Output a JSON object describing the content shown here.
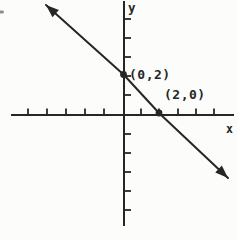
{
  "diagram": {
    "colors": {
      "background": "#fcfcfb",
      "ink": "#262626",
      "stray": "#8f8f8f"
    },
    "x_axis": {
      "label": "x",
      "axis_y": 115,
      "x_start": 11,
      "x_end": 234,
      "label_pos": {
        "x": 226,
        "y": 133
      },
      "label_font_size": 11.5,
      "ticks": [
        28,
        47,
        66,
        85,
        104,
        141,
        159,
        178,
        196,
        214
      ],
      "tick_length": 6.5
    },
    "y_axis": {
      "label": "y",
      "axis_x": 124,
      "y_start": 1,
      "y_end": 226,
      "label_pos": {
        "x": 128,
        "y": 12
      },
      "label_font_size": 12.5,
      "ticks": [
        19,
        38,
        57,
        76,
        95,
        134,
        153,
        172,
        191,
        210
      ],
      "tick_length": 7
    },
    "line": {
      "path": [
        [
          46,
          5
        ],
        [
          123.5,
          74.5
        ],
        [
          159,
          113
        ],
        [
          228,
          178
        ]
      ],
      "arrow_size": 13,
      "arrow_half_width": 4.8,
      "stroke_width": 2
    },
    "points": [
      {
        "label": "(0,2)",
        "coords": {
          "x": 0,
          "y": 2
        },
        "dot": {
          "cx": 123.5,
          "cy": 74.5,
          "r": 3.4
        },
        "label_pos": {
          "x": 129,
          "y": 79
        },
        "label_font_size": 13
      },
      {
        "label": "(2,0)",
        "coords": {
          "x": 2,
          "y": 0
        },
        "dot": {
          "cx": 159,
          "cy": 113,
          "r": 3.4
        },
        "label_pos": {
          "x": 164,
          "y": 99
        },
        "label_font_size": 13
      }
    ],
    "stray_mark": {
      "x": -1,
      "y": 10.5,
      "width": 5,
      "height": 3
    }
  }
}
